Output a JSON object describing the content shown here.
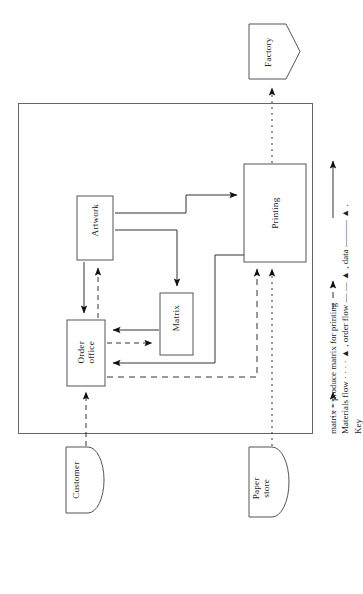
{
  "diagram": {
    "orientation": "rotated-90-ccw",
    "system_boundary": {
      "name": "company-boundary",
      "label": ""
    },
    "processes": [
      {
        "id": "order-office",
        "label": "Order\noffice"
      },
      {
        "id": "artwork",
        "label": "Artwork"
      },
      {
        "id": "matrix",
        "label": "Matrix"
      },
      {
        "id": "printing",
        "label": "Printing"
      }
    ],
    "externals": [
      {
        "id": "customer",
        "label": "Customer",
        "shape": "rounded"
      },
      {
        "id": "paper-store",
        "label": "Paper\nstore",
        "shape": "rounded"
      },
      {
        "id": "factory",
        "label": "Factory",
        "shape": "home-plate"
      }
    ],
    "key": {
      "title": "Key",
      "line1": "Materials flow · · · · ▲ , order flow —  — ▲ , data ——— ▲ .",
      "line1_parts": {
        "materials": "Materials flow",
        "materials_style": "dotted",
        "order": ", order flow",
        "order_style": "dashed",
        "data": ", data",
        "data_style": "solid",
        "terminator": "."
      },
      "line2": "matrix = produce matrix for printing"
    },
    "flows": [
      {
        "from": "customer",
        "to": "order-office",
        "style": "dashed",
        "meaning": "order flow"
      },
      {
        "from": "order-office",
        "to": "artwork",
        "style": "solid",
        "meaning": "data"
      },
      {
        "from": "artwork",
        "to": "order-office",
        "style": "dashed",
        "meaning": "order flow"
      },
      {
        "from": "artwork",
        "to": "matrix",
        "style": "solid",
        "meaning": "data"
      },
      {
        "from": "artwork",
        "to": "printing",
        "style": "solid",
        "meaning": "data"
      },
      {
        "from": "matrix",
        "to": "order-office",
        "style": "solid",
        "meaning": "data"
      },
      {
        "from": "order-office",
        "to": "matrix",
        "style": "dashed",
        "meaning": "order flow"
      },
      {
        "from": "printing",
        "to": "order-office",
        "style": "solid",
        "meaning": "data"
      },
      {
        "from": "order-office",
        "to": "printing",
        "style": "dashed",
        "meaning": "order flow"
      },
      {
        "from": "paper-store",
        "to": "printing",
        "style": "dotted",
        "meaning": "materials flow"
      },
      {
        "from": "printing",
        "to": "factory",
        "style": "dotted",
        "meaning": "materials flow"
      }
    ]
  },
  "colors": {
    "stroke": "#444444",
    "ink": "#222222",
    "background": "#ffffff"
  }
}
